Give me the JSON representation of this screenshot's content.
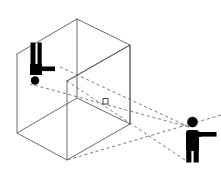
{
  "scene": {
    "title": "Robot gripper in workspace box observed by pointing person",
    "background_color": "#ffffff",
    "width": 221,
    "height": 178
  },
  "colors": {
    "wireframe_stroke": "#5a5a5a",
    "sightline_stroke": "#6e6e6e",
    "silhouette_fill": "#000000",
    "marker_fill": "#ffffff",
    "marker_stroke": "#333333"
  },
  "workspace_box": {
    "label": "workspace-cuboid",
    "style": "wireframe",
    "front_face": {
      "label": "front-face",
      "points": "17,54 17,133 67,160 67,81"
    },
    "top_face": {
      "label": "top-face",
      "points": "17,54 77,19 130,45 67,81"
    },
    "right_face": {
      "label": "right-face",
      "points": "67,81 130,45 130,124 67,160"
    },
    "back_left_edge": {
      "label": "back-left-vertical-edge",
      "points": "77,19 77,98"
    },
    "back_bottom_edges": {
      "label": "back-bottom-edges",
      "points": "17,133 77,98 130,124"
    },
    "hidden_vertical_edge": {
      "label": "hidden-vertical-edge",
      "points": "130,45 130,124"
    }
  },
  "robot_gripper": {
    "label": "robot-gripper",
    "finger_left": {
      "x": 30.5,
      "y": 42.5,
      "w": 5.0,
      "h": 31.0
    },
    "finger_right": {
      "x": 37.5,
      "y": 42.5,
      "w": 4.2,
      "h": 24.0
    },
    "finger_gap_note": "vertical slot between two gripper fingers",
    "wrist_block": {
      "x": 30.0,
      "y": 64.0,
      "w": 12.0,
      "h": 11.0
    },
    "arm_bar": {
      "x": 39.0,
      "y": 66.5,
      "w": 16.0,
      "h": 4.6
    },
    "base_dot": {
      "cx": 35.0,
      "cy": 80.5,
      "r": 4.2
    }
  },
  "target_object": {
    "label": "target-object-marker",
    "x": 103.0,
    "y": 98.5,
    "w": 5.0,
    "h": 5.5
  },
  "person": {
    "label": "pointing-person",
    "head": {
      "cx": 192.5,
      "cy": 122.0,
      "r": 5.3
    },
    "torso": {
      "x": 186.0,
      "y": 130.0,
      "w": 13.0,
      "h": 21.0,
      "rx": 3.0
    },
    "leg_left": {
      "x": 186.2,
      "y": 145.0,
      "w": 5.2,
      "h": 17.5
    },
    "leg_right": {
      "x": 193.6,
      "y": 145.0,
      "w": 5.2,
      "h": 17.5
    },
    "arm": {
      "x": 199.0,
      "y": 132.0,
      "w": 17.5,
      "h": 4.6
    },
    "shoulder_joint": {
      "cx": 199.5,
      "cy": 134.3,
      "r": 2.6
    },
    "facing": "right"
  },
  "sight_lines": {
    "label": "observation-sight-lines",
    "origin": {
      "x": 189.0,
      "y": 127.0
    },
    "rays": [
      {
        "name": "ray-to-gripper-upper",
        "d": "M 189,127 L 58,66"
      },
      {
        "name": "ray-to-box-mid",
        "d": "M 189,127 L 30,84"
      },
      {
        "name": "ray-to-box-lower-front",
        "d": "M 185,160 L 67,81"
      },
      {
        "name": "ray-through-object",
        "d": "M 221,115 L 67,160"
      }
    ]
  }
}
